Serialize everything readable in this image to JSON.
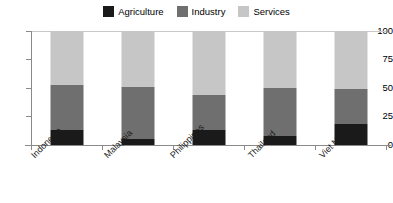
{
  "chart_data": {
    "type": "bar",
    "subtype": "stacked-100-percent",
    "title": "",
    "subtitle": "",
    "xlabel": "",
    "ylabel": "",
    "ylim": [
      0,
      100
    ],
    "yticks": [
      "0",
      "25",
      "50",
      "75",
      "100"
    ],
    "grid": false,
    "legend_position": "top-center",
    "categories": [
      "Indonesia",
      "Malaysia",
      "Philippines",
      "Thailand",
      "Viet Nam"
    ],
    "series": [
      {
        "name": "Agriculture",
        "color": "#1a1a1a",
        "values": [
          13,
          5,
          13,
          8,
          18
        ]
      },
      {
        "name": "Industry",
        "color": "#6f6f6f",
        "values": [
          40,
          46,
          31,
          42,
          31
        ]
      },
      {
        "name": "Services",
        "color": "#c6c6c6",
        "values": [
          47,
          49,
          56,
          50,
          51
        ]
      }
    ],
    "stack_tops": {
      "Indonesia": [
        13,
        53,
        100
      ],
      "Malaysia": [
        5,
        51,
        100
      ],
      "Philippines": [
        13,
        44,
        100
      ],
      "Thailand": [
        8,
        50,
        100
      ],
      "Viet Nam": [
        18,
        49,
        100
      ]
    }
  },
  "legend": {
    "items": [
      {
        "label": "Agriculture",
        "color": "#1a1a1a"
      },
      {
        "label": "Industry",
        "color": "#6f6f6f"
      },
      {
        "label": "Services",
        "color": "#c6c6c6"
      }
    ]
  },
  "axes": {
    "y": {
      "ticks": [
        "100",
        "75",
        "50",
        "25",
        "0"
      ]
    },
    "x": {
      "labels": [
        "Indonesia",
        "Malaysia",
        "Philippines",
        "Thailand",
        "Viet Nam"
      ]
    }
  }
}
